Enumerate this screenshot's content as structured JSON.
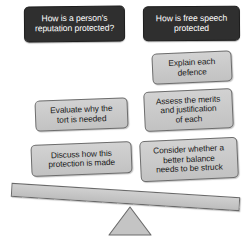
{
  "diagram": {
    "type": "seesaw-balance-diagram",
    "title_visible": false,
    "colors": {
      "header_fill": "#2f2f2f",
      "header_text": "#ffffff",
      "task_fill": "#c9c9c9",
      "task_text": "#191919",
      "task_stroke": "#6d6d6d",
      "beam_fill": "#c6c6c6",
      "beam_stroke": "#6a6a6a",
      "fulcrum_fill": "#c4c4c4",
      "fulcrum_stroke": "#6a6a6a",
      "background": "#ffffff"
    },
    "left_column": {
      "header": {
        "label": "How is a person's\nreputation protected?"
      },
      "tasks": [
        {
          "label": "Evaluate why the\ntort is needed"
        },
        {
          "label": "Discuss how this\nprotection is made"
        }
      ]
    },
    "right_column": {
      "header": {
        "label": "How is free speech\nprotected"
      },
      "tasks": [
        {
          "label": "Explain each\ndefence"
        },
        {
          "label": "Assess the merits\nand justification\nof each"
        },
        {
          "label": "Consider whether a\nbetter balance\nneeds to be struck"
        }
      ]
    },
    "beam": {
      "name": "balance-beam",
      "tilt_degrees": 3.6
    },
    "fulcrum": {
      "name": "fulcrum-triangle",
      "shape": "triangle"
    }
  }
}
